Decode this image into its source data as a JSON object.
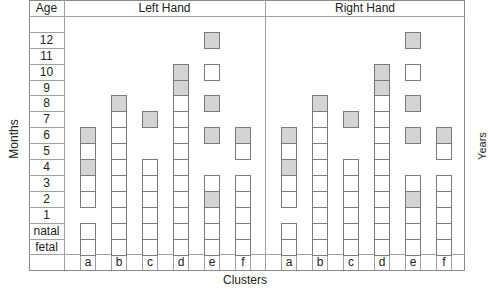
{
  "chart_data": {
    "type": "table",
    "title": "",
    "xlabel": "Clusters",
    "ylabel": "Months",
    "right_label": "Years",
    "age_header": "Age",
    "age_rows": [
      "",
      "12",
      "11",
      "10",
      "9",
      "8",
      "7",
      "6",
      "5",
      "4",
      "3",
      "2",
      "1",
      "natal",
      "fetal"
    ],
    "clusters": [
      "a",
      "b",
      "c",
      "d",
      "e",
      "f"
    ],
    "legend": {
      "gray": "highlighted month",
      "white": "present"
    },
    "panels": [
      {
        "name": "Left Hand",
        "columns": {
          "a": {
            "gray": [
              "6",
              "4"
            ],
            "white": [
              "5",
              "3",
              "2",
              "natal",
              "fetal"
            ]
          },
          "b": {
            "gray": [
              "8"
            ],
            "white": [
              "7",
              "6",
              "5",
              "4",
              "3",
              "2",
              "1",
              "natal",
              "fetal"
            ]
          },
          "c": {
            "gray": [
              "7"
            ],
            "white": [
              "4",
              "3",
              "2",
              "1",
              "natal",
              "fetal"
            ]
          },
          "d": {
            "gray": [
              "10",
              "9"
            ],
            "white": [
              "8",
              "7",
              "6",
              "5",
              "4",
              "3",
              "2",
              "1",
              "natal",
              "fetal"
            ]
          },
          "e": {
            "gray": [
              "12",
              "8",
              "6",
              "2"
            ],
            "white": [
              "10",
              "3",
              "1",
              "natal",
              "fetal"
            ]
          },
          "f": {
            "gray": [
              "6"
            ],
            "white": [
              "5",
              "3",
              "2",
              "1",
              "natal",
              "fetal"
            ]
          }
        }
      },
      {
        "name": "Right Hand",
        "columns": {
          "a": {
            "gray": [
              "6",
              "4"
            ],
            "white": [
              "5",
              "3",
              "2",
              "natal",
              "fetal"
            ]
          },
          "b": {
            "gray": [
              "8"
            ],
            "white": [
              "7",
              "6",
              "5",
              "4",
              "3",
              "2",
              "1",
              "natal",
              "fetal"
            ]
          },
          "c": {
            "gray": [
              "7"
            ],
            "white": [
              "4",
              "3",
              "2",
              "1",
              "natal",
              "fetal"
            ]
          },
          "d": {
            "gray": [
              "10",
              "9"
            ],
            "white": [
              "8",
              "7",
              "6",
              "5",
              "4",
              "3",
              "2",
              "1",
              "natal",
              "fetal"
            ]
          },
          "e": {
            "gray": [
              "12",
              "8",
              "6",
              "2"
            ],
            "white": [
              "10",
              "3",
              "1",
              "natal",
              "fetal"
            ]
          },
          "f": {
            "gray": [
              "6"
            ],
            "white": [
              "5",
              "3",
              "2",
              "1",
              "natal",
              "fetal"
            ]
          }
        }
      }
    ],
    "colors": {
      "gray_fill": "#d4d4d4",
      "border": "#7a7a7a"
    }
  }
}
